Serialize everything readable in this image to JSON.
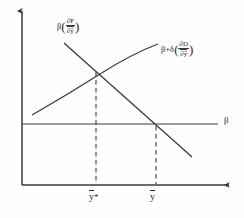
{
  "figure": {
    "background_color": "#fefefe",
    "line_color": "#3a3a3a",
    "text_color": "#2a2a2a"
  },
  "axes": {
    "horizontal_axis_name": "y-bar axis",
    "vertical_axis_name": "value axis",
    "beta_level_line_label": "β",
    "origin": {
      "x": 22,
      "y": 185
    },
    "x_axis_end": {
      "x": 232,
      "y": 185
    },
    "y_axis_top": {
      "x": 22,
      "y": 8
    },
    "beta_line_y": 124,
    "beta_line_x_end": 218
  },
  "curves": [
    {
      "id": "upward-concave-curve",
      "label_text": "β+δ(∂D/∂ȳ)",
      "label_parts": {
        "prefix": "β+δ",
        "open_paren": "(",
        "numerator": "∂D",
        "denominator": "∂ȳ",
        "close_paren": ")"
      },
      "shape": "increasing-concave",
      "points": [
        [
          32,
          115
        ],
        [
          60,
          97
        ],
        [
          90,
          78
        ],
        [
          120,
          62
        ],
        [
          145,
          51
        ],
        [
          158,
          44
        ]
      ]
    },
    {
      "id": "downward-sloping-line",
      "label_text": "β(∂F/∂ȳ)",
      "label_parts": {
        "prefix": "β",
        "open_paren": "(",
        "numerator": "∂F",
        "denominator": "∂ȳ",
        "close_paren": ")"
      },
      "shape": "decreasing-linear",
      "points": [
        [
          64,
          43
        ],
        [
          192,
          157
        ]
      ]
    }
  ],
  "intersections": [
    {
      "id": "optimum-intersection",
      "description": "curve crossing point",
      "x": 96,
      "y": 70,
      "tick_label": "ȳ*",
      "tick_label_base": "y",
      "tick_label_suffix": "*",
      "dashed_guide": {
        "x": 96,
        "y_top": 70,
        "y_bottom": 185
      }
    },
    {
      "id": "equilibrium-intersection",
      "description": "line crossing the beta level line",
      "x": 156,
      "y": 124,
      "tick_label": "ȳ",
      "tick_label_base": "y",
      "tick_label_suffix": "",
      "dashed_guide": {
        "x": 156,
        "y_top": 124,
        "y_bottom": 185
      }
    }
  ],
  "ticks": [
    {
      "id": "tick-ystar",
      "x": 96,
      "label": "ȳ*"
    },
    {
      "id": "tick-ybar",
      "x": 156,
      "label": "ȳ"
    }
  ],
  "symbols": {
    "beta": "β",
    "delta": "δ",
    "partial": "∂",
    "F": "F",
    "D": "D",
    "y": "y",
    "plus": "+",
    "star": "*",
    "open_paren": "(",
    "close_paren": ")"
  }
}
